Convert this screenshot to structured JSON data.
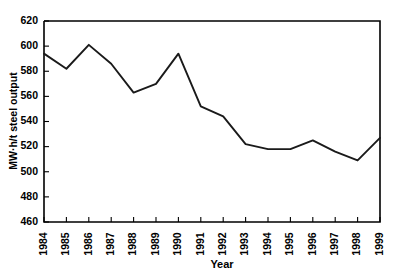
{
  "chart_data": {
    "type": "line",
    "title": "",
    "subtitle": "",
    "xlabel": "Year",
    "ylabel": "MW·h/t steel output",
    "xlim": [
      1984,
      1999
    ],
    "ylim": [
      460,
      620
    ],
    "ytick_step": 20,
    "grid": false,
    "legend": "none",
    "categories": [
      "1984",
      "1985",
      "1986",
      "1987",
      "1988",
      "1989",
      "1990",
      "1991",
      "1992",
      "1993",
      "1994",
      "1995",
      "1996",
      "1997",
      "1998",
      "1999"
    ],
    "x": [
      1984,
      1985,
      1986,
      1987,
      1988,
      1989,
      1990,
      1991,
      1992,
      1993,
      1994,
      1995,
      1996,
      1997,
      1998,
      1999
    ],
    "values": [
      594,
      582,
      601,
      586,
      563,
      570,
      594,
      552,
      544,
      522,
      518,
      518,
      525,
      516,
      509,
      527
    ],
    "ytick_labels": [
      "620",
      "600",
      "580",
      "560",
      "540",
      "520",
      "500",
      "480",
      "460"
    ],
    "ytick_values": [
      620,
      600,
      580,
      560,
      540,
      520,
      500,
      480,
      460
    ],
    "series": [
      {
        "name": "MW·h/t steel output",
        "color": "#1a1a1a",
        "values": [
          594,
          582,
          601,
          586,
          563,
          570,
          594,
          552,
          544,
          522,
          518,
          518,
          525,
          516,
          509,
          527
        ]
      }
    ],
    "annotations": []
  },
  "axes": {
    "x_title": "Year",
    "y_title": "MW·h/t steel output"
  },
  "colors": {
    "line": "#1a1a1a",
    "frame": "#000000",
    "background": "#ffffff"
  }
}
